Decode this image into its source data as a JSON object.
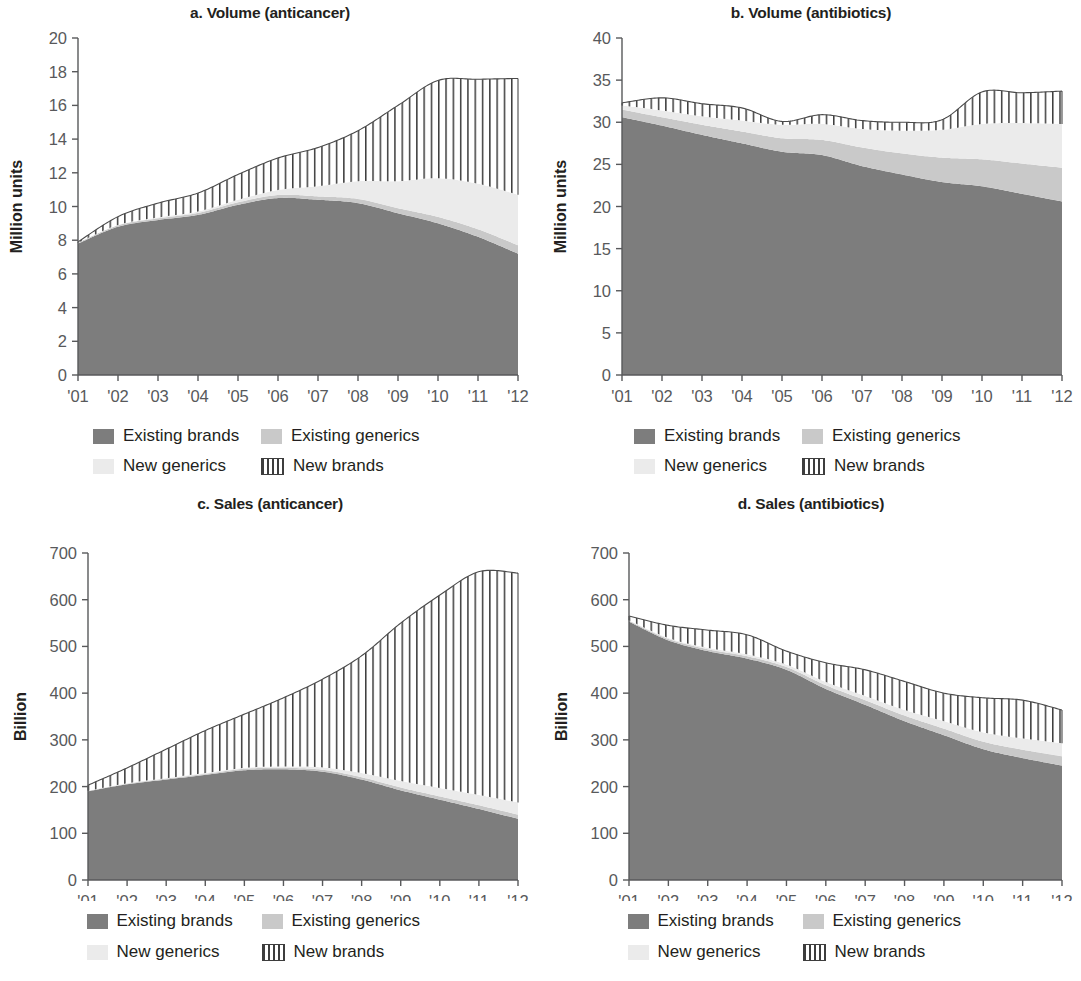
{
  "figure": {
    "series_names": [
      "Existing brands",
      "Existing generics",
      "New generics",
      "New brands"
    ],
    "colors": {
      "existing_brands": "#7d7d7d",
      "existing_generics": "#c9c9c9",
      "new_generics": "#ebebeb",
      "new_brands_stroke": "#3d3d3d",
      "new_brands_fill": "#ffffff",
      "axis": "#58595b",
      "text": "#231f20"
    }
  },
  "legend": {
    "items": [
      {
        "label": "Existing brands",
        "swatch": "existing-brands-swatch"
      },
      {
        "label": "Existing generics",
        "swatch": "existing-generics-swatch"
      },
      {
        "label": "New generics",
        "swatch": "new-generics-swatch"
      },
      {
        "label": "New brands",
        "swatch": "new-brands-swatch"
      }
    ]
  },
  "panels": {
    "a": {
      "title": "a. Volume (anticancer)"
    },
    "b": {
      "title": "b. Volume (antibiotics)"
    },
    "c": {
      "title": "c. Sales (anticancer)"
    },
    "d": {
      "title": "d. Sales (antibiotics)"
    }
  },
  "chart_data": [
    {
      "id": "a",
      "type": "area",
      "title": "a. Volume (anticancer)",
      "xlabel": "",
      "ylabel": "Million units",
      "ylim": [
        0,
        20
      ],
      "yticks": [
        0,
        2,
        4,
        6,
        8,
        10,
        12,
        14,
        16,
        18,
        20
      ],
      "xticks": [
        "'01",
        "'02",
        "'03",
        "'04",
        "'05",
        "'06",
        "'07",
        "'08",
        "'09",
        "'10",
        "'11",
        "'12"
      ],
      "x": [
        2001,
        2002,
        2003,
        2004,
        2005,
        2006,
        2007,
        2008,
        2009,
        2010,
        2011,
        2012
      ],
      "stacked": true,
      "grid": false,
      "legend_position": "bottom",
      "series": [
        {
          "name": "Existing brands",
          "values": [
            7.8,
            8.8,
            9.2,
            9.5,
            10.1,
            10.5,
            10.4,
            10.2,
            9.6,
            9.0,
            8.2,
            7.2
          ]
        },
        {
          "name": "Existing generics",
          "values": [
            0.05,
            0.08,
            0.1,
            0.12,
            0.15,
            0.18,
            0.2,
            0.25,
            0.3,
            0.38,
            0.45,
            0.5
          ]
        },
        {
          "name": "New generics",
          "values": [
            0.0,
            0.02,
            0.05,
            0.08,
            0.15,
            0.3,
            0.6,
            1.05,
            1.6,
            2.3,
            2.7,
            3.0
          ]
        },
        {
          "name": "New brands",
          "values": [
            0.05,
            0.5,
            0.85,
            1.1,
            1.5,
            1.9,
            2.3,
            3.0,
            4.5,
            5.8,
            6.2,
            6.9
          ]
        }
      ],
      "totals": [
        7.9,
        9.4,
        10.2,
        10.8,
        11.9,
        12.9,
        13.5,
        14.5,
        16.0,
        17.0,
        17.0,
        17.6
      ]
    },
    {
      "id": "b",
      "type": "area",
      "title": "b. Volume (antibiotics)",
      "xlabel": "",
      "ylabel": "Million units",
      "ylim": [
        0,
        40
      ],
      "yticks": [
        0,
        5,
        10,
        15,
        20,
        25,
        30,
        35,
        40
      ],
      "xticks": [
        "'01",
        "'02",
        "'03",
        "'04",
        "'05",
        "'06",
        "'07",
        "'08",
        "'09",
        "'10",
        "'11",
        "'12"
      ],
      "x": [
        2001,
        2002,
        2003,
        2004,
        2005,
        2006,
        2007,
        2008,
        2009,
        2010,
        2011,
        2012
      ],
      "stacked": true,
      "grid": false,
      "legend_position": "bottom",
      "series": [
        {
          "name": "Existing brands",
          "values": [
            30.6,
            29.6,
            28.5,
            27.5,
            26.5,
            26.1,
            24.8,
            23.8,
            22.9,
            22.4,
            21.5,
            20.6
          ]
        },
        {
          "name": "Existing generics",
          "values": [
            0.9,
            1.0,
            1.2,
            1.4,
            1.6,
            1.8,
            2.2,
            2.5,
            2.9,
            3.2,
            3.6,
            4.0
          ]
        },
        {
          "name": "New generics",
          "values": [
            0.5,
            0.8,
            1.0,
            1.3,
            1.6,
            1.9,
            2.2,
            2.7,
            3.3,
            4.2,
            4.8,
            5.2
          ]
        },
        {
          "name": "New brands",
          "values": [
            0.3,
            1.5,
            1.5,
            1.5,
            0.4,
            1.1,
            1.0,
            1.0,
            1.2,
            3.8,
            3.6,
            3.9
          ]
        }
      ],
      "totals": [
        32.3,
        32.9,
        32.2,
        31.7,
        30.1,
        30.9,
        30.2,
        30.0,
        30.3,
        33.6,
        33.5,
        33.7
      ]
    },
    {
      "id": "c",
      "type": "area",
      "title": "c. Sales (anticancer)",
      "xlabel": "",
      "ylabel": "Billion",
      "ylim": [
        0,
        700
      ],
      "yticks": [
        0,
        100,
        200,
        300,
        400,
        500,
        600,
        700
      ],
      "xticks": [
        "'01",
        "'02",
        "'03",
        "'04",
        "'05",
        "'06",
        "'07",
        "'08",
        "'09",
        "'10",
        "'11",
        "'12"
      ],
      "x": [
        2001,
        2002,
        2003,
        2004,
        2005,
        2006,
        2007,
        2008,
        2009,
        2010,
        2011,
        2012
      ],
      "stacked": true,
      "grid": false,
      "legend_position": "bottom",
      "series": [
        {
          "name": "Existing brands",
          "values": [
            190,
            205,
            215,
            225,
            235,
            237,
            232,
            215,
            192,
            172,
            152,
            131
          ]
        },
        {
          "name": "Existing generics",
          "values": [
            1,
            1,
            2,
            2,
            3,
            3,
            4,
            5,
            6,
            7,
            8,
            9
          ]
        },
        {
          "name": "New generics",
          "values": [
            0,
            1,
            1,
            2,
            2,
            3,
            5,
            9,
            14,
            18,
            22,
            26
          ]
        },
        {
          "name": "New brands",
          "values": [
            12,
            33,
            62,
            91,
            115,
            147,
            189,
            251,
            338,
            413,
            478,
            491
          ]
        }
      ],
      "totals": [
        203,
        240,
        280,
        320,
        355,
        390,
        430,
        480,
        550,
        610,
        660,
        657
      ]
    },
    {
      "id": "d",
      "type": "area",
      "title": "d. Sales (antibiotics)",
      "xlabel": "",
      "ylabel": "Billion",
      "ylim": [
        0,
        700
      ],
      "yticks": [
        0,
        100,
        200,
        300,
        400,
        500,
        600,
        700
      ],
      "xticks": [
        "'01",
        "'02",
        "'03",
        "'04",
        "'05",
        "'06",
        "'07",
        "'08",
        "'09",
        "'10",
        "'11",
        "'12"
      ],
      "x": [
        2001,
        2002,
        2003,
        2004,
        2005,
        2006,
        2007,
        2008,
        2009,
        2010,
        2011,
        2012
      ],
      "stacked": true,
      "grid": false,
      "legend_position": "bottom",
      "series": [
        {
          "name": "Existing brands",
          "values": [
            553,
            513,
            490,
            474,
            450,
            409,
            375,
            340,
            310,
            280,
            261,
            245
          ]
        },
        {
          "name": "Existing generics",
          "values": [
            2,
            3,
            4,
            5,
            6,
            8,
            10,
            12,
            14,
            16,
            18,
            20
          ]
        },
        {
          "name": "New generics",
          "values": [
            1,
            2,
            3,
            4,
            5,
            7,
            9,
            12,
            16,
            20,
            24,
            28
          ]
        },
        {
          "name": "New brands",
          "values": [
            9,
            27,
            38,
            42,
            29,
            41,
            56,
            61,
            60,
            74,
            82,
            71
          ]
        }
      ],
      "totals": [
        565,
        545,
        535,
        525,
        490,
        465,
        450,
        425,
        400,
        390,
        385,
        364
      ]
    }
  ]
}
